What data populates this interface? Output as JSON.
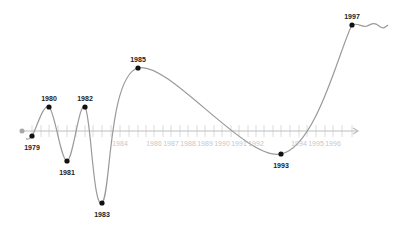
{
  "diagram": {
    "type": "timeline-wave",
    "colors": {
      "axis": "#bdbdbd",
      "tick": "#dcdcdc",
      "curve": "#9a9a9a",
      "point": "#111111",
      "label": "#222222",
      "axis_label": "#c8c8c8",
      "start_dot": "#a8a8a8"
    },
    "axis": {
      "y": 131,
      "x_start": 22,
      "x_end": 358
    },
    "points": [
      {
        "year": "1979",
        "x": 32,
        "y": 136,
        "label_pos": "below"
      },
      {
        "year": "1980",
        "x": 49,
        "y": 107,
        "label_pos": "above"
      },
      {
        "year": "1981",
        "x": 67,
        "y": 161,
        "label_pos": "below"
      },
      {
        "year": "1982",
        "x": 85,
        "y": 107,
        "label_pos": "above"
      },
      {
        "year": "1983",
        "x": 102,
        "y": 203,
        "label_pos": "below"
      },
      {
        "year": "1985",
        "x": 138,
        "y": 68,
        "label_pos": "above"
      },
      {
        "year": "1993",
        "x": 281,
        "y": 154,
        "label_pos": "below"
      },
      {
        "year": "1997",
        "x": 352,
        "y": 25,
        "label_pos": "above"
      }
    ],
    "axis_labels": [
      {
        "year": "1984",
        "x": 120
      },
      {
        "year": "1986",
        "x": 154
      },
      {
        "year": "1987",
        "x": 171
      },
      {
        "year": "1988",
        "x": 188
      },
      {
        "year": "1989",
        "x": 205
      },
      {
        "year": "1990",
        "x": 222
      },
      {
        "year": "1991",
        "x": 239
      },
      {
        "year": "1992",
        "x": 256
      },
      {
        "year": "1994",
        "x": 299
      },
      {
        "year": "1995",
        "x": 316
      },
      {
        "year": "1996",
        "x": 333
      }
    ],
    "ticks_x": [
      32,
      41,
      49,
      58,
      67,
      76,
      85,
      93,
      102,
      111,
      120,
      129,
      138,
      146,
      154,
      163,
      171,
      180,
      188,
      197,
      205,
      214,
      222,
      231,
      239,
      248,
      256,
      264,
      273,
      281,
      290,
      299,
      307,
      316,
      325,
      333,
      342,
      352
    ]
  },
  "chart_data": {
    "type": "line",
    "title": "",
    "xlabel": "",
    "ylabel": "",
    "x": [
      "1979",
      "1980",
      "1981",
      "1982",
      "1983",
      "1984",
      "1985",
      "1986",
      "1987",
      "1988",
      "1989",
      "1990",
      "1991",
      "1992",
      "1993",
      "1994",
      "1995",
      "1996",
      "1997"
    ],
    "highlighted_points": [
      "1979",
      "1980",
      "1981",
      "1982",
      "1983",
      "1985",
      "1993",
      "1997"
    ],
    "relative_values": {
      "1979": -5,
      "1980": 24,
      "1981": -30,
      "1982": 24,
      "1983": -72,
      "1985": 63,
      "1993": -23,
      "1997": 106
    },
    "grid": false,
    "legend": null
  }
}
